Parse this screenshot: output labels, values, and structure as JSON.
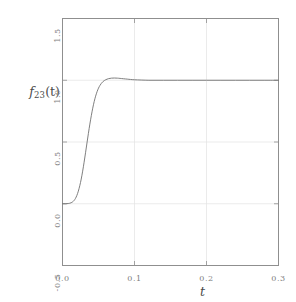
{
  "chart_data": {
    "type": "line",
    "title": "",
    "subtitle": "",
    "xlabel": "t",
    "ylabel": "f23(t)",
    "ylabel_base": "f",
    "ylabel_sub": "23",
    "ylabel_arg": "(t)",
    "xlim": [
      0.0,
      0.3
    ],
    "ylim": [
      -0.5,
      1.5
    ],
    "grid": true,
    "legend": null,
    "legend_position": "none",
    "xticks": [
      0.0,
      0.1,
      0.2,
      0.3
    ],
    "xticklabels": [
      "0.0",
      "0.1",
      "0.2",
      "0.3"
    ],
    "yticks": [
      -0.5,
      0.0,
      0.5,
      1.0,
      1.5
    ],
    "yticklabels": [
      "-0.5",
      "0.0",
      "0.5",
      "1.0",
      "1.5"
    ],
    "line_color": "#707070",
    "grid_color": "#e2e2e2",
    "frame_color": "#8f8f8f",
    "background_color": "#ffffff",
    "series": [
      {
        "name": "f23(t)",
        "x": [
          0.0,
          0.002,
          0.004,
          0.006,
          0.008,
          0.01,
          0.012,
          0.014,
          0.016,
          0.018,
          0.02,
          0.022,
          0.024,
          0.026,
          0.028,
          0.03,
          0.032,
          0.034,
          0.036,
          0.038,
          0.04,
          0.042,
          0.044,
          0.046,
          0.048,
          0.05,
          0.052,
          0.054,
          0.056,
          0.058,
          0.06,
          0.064,
          0.068,
          0.072,
          0.076,
          0.08,
          0.09,
          0.1,
          0.12,
          0.14,
          0.16,
          0.18,
          0.2,
          0.22,
          0.24,
          0.26,
          0.28,
          0.3
        ],
        "y": [
          0.0,
          0.0,
          0.0,
          0.001,
          0.002,
          0.004,
          0.008,
          0.015,
          0.026,
          0.043,
          0.068,
          0.102,
          0.146,
          0.2,
          0.264,
          0.336,
          0.413,
          0.492,
          0.57,
          0.645,
          0.713,
          0.774,
          0.827,
          0.871,
          0.907,
          0.936,
          0.958,
          0.975,
          0.988,
          0.997,
          1.004,
          1.013,
          1.017,
          1.018,
          1.017,
          1.015,
          1.009,
          1.004,
          1.0,
          1.0,
          1.0,
          1.0,
          1.0,
          1.0,
          1.0,
          1.0,
          1.0,
          1.0
        ]
      }
    ]
  },
  "axes": {
    "x_tick_labels": [
      "0.0",
      "0.1",
      "0.2",
      "0.3"
    ],
    "y_tick_labels": [
      "1.5",
      "1.0",
      "0.5",
      "0.0",
      "-0.5"
    ],
    "x_axis_label": "t",
    "y_axis_label": "f23(t)"
  }
}
